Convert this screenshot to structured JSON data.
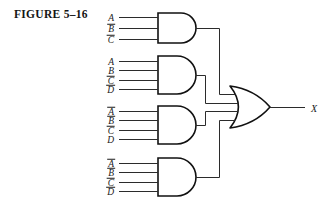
{
  "figure": {
    "caption": "FIGURE 5–16",
    "width": 335,
    "height": 214
  },
  "colors": {
    "background": "#ffffff",
    "wire": "#2b2b2b",
    "gate_outline": "#111111",
    "text": "#1a1a1a"
  },
  "circuit": {
    "type": "and-or-sum-of-products",
    "expression": "X = A B̄ C̄ + A B C̄ D̄ + Ā B̄ C̄ D + Ā B̄ C̄ D̄",
    "output": {
      "label": "X",
      "name": "output-x"
    },
    "or_gate": {
      "name": "or-gate",
      "label": "OR",
      "input_count": 4
    },
    "and_gates": [
      {
        "name": "and-gate-1",
        "label": "AND",
        "inputs": [
          {
            "letter": "A",
            "inverted": false
          },
          {
            "letter": "B",
            "inverted": true
          },
          {
            "letter": "C",
            "inverted": true
          }
        ]
      },
      {
        "name": "and-gate-2",
        "label": "AND",
        "inputs": [
          {
            "letter": "A",
            "inverted": false
          },
          {
            "letter": "B",
            "inverted": false
          },
          {
            "letter": "C",
            "inverted": true
          },
          {
            "letter": "D",
            "inverted": true
          }
        ]
      },
      {
        "name": "and-gate-3",
        "label": "AND",
        "inputs": [
          {
            "letter": "A",
            "inverted": true
          },
          {
            "letter": "B",
            "inverted": true
          },
          {
            "letter": "C",
            "inverted": true
          },
          {
            "letter": "D",
            "inverted": false
          }
        ]
      },
      {
        "name": "and-gate-4",
        "label": "AND",
        "inputs": [
          {
            "letter": "A",
            "inverted": true
          },
          {
            "letter": "B",
            "inverted": true
          },
          {
            "letter": "C",
            "inverted": true
          },
          {
            "letter": "D",
            "inverted": true
          }
        ]
      }
    ]
  },
  "geometry": {
    "and_gates": [
      {
        "x": 158,
        "y": 13,
        "w": 38,
        "h": 30,
        "stubs": [
          0,
          0,
          0
        ]
      },
      {
        "x": 158,
        "y": 56,
        "w": 38,
        "h": 38,
        "stubs": [
          26,
          16,
          8,
          20
        ]
      },
      {
        "x": 158,
        "y": 106,
        "w": 38,
        "h": 38,
        "stubs": [
          26,
          16,
          8,
          20
        ]
      },
      {
        "x": 158,
        "y": 158,
        "w": 38,
        "h": 38,
        "stubs": [
          26,
          16,
          8,
          20
        ]
      }
    ],
    "label_x": 115,
    "or_gate": {
      "x": 230,
      "y": 86,
      "w": 40,
      "h": 42
    },
    "output_wire_end": 305,
    "bus_x": [
      219,
      205,
      205,
      219
    ]
  }
}
